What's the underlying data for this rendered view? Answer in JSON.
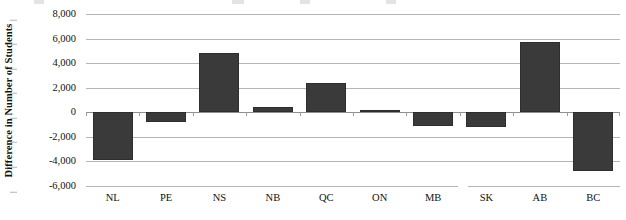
{
  "chart_data": {
    "type": "bar",
    "title": "",
    "xlabel": "",
    "ylabel": "Difference in Number of Students",
    "categories": [
      "NL",
      "PE",
      "NS",
      "NB",
      "QC",
      "ON",
      "MB",
      "SK",
      "AB",
      "BC"
    ],
    "values": [
      -3900,
      -800,
      4800,
      400,
      2400,
      200,
      -1100,
      -1200,
      5700,
      -4800
    ],
    "ylim": [
      -6000,
      8000
    ],
    "ytick_values": [
      8000,
      6000,
      4000,
      2000,
      0,
      -2000,
      -4000,
      -6000
    ],
    "ytick_labels": [
      "8,000",
      "6,000",
      "4,000",
      "2,000",
      "0",
      "-2,000",
      "-4,000",
      "-6,000"
    ],
    "grid": true,
    "legend": "none",
    "bar_color": "#3a3a3a",
    "grid_color": "#b5b5b5",
    "background_color": "#ffffff"
  },
  "axis": {
    "y_title": "Difference in Number of Students"
  }
}
